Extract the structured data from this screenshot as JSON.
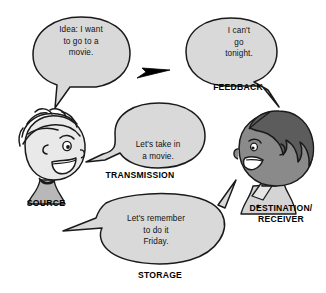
{
  "figure": {
    "background_color": "#ffffff",
    "bubble_fill": "#d9d9d9",
    "outline_color": "#1a1a1a",
    "source_face_color": "#e3e3e3",
    "destination_face_color": "#8a8a8a",
    "destination_hair_color": "#5c5c5c",
    "arrow_color": "#000000"
  },
  "speech_bubbles": [
    {
      "id": "idea",
      "text": "Idea: I want\nto go to a\nmovie.",
      "owner": "source",
      "tail_direction": "down-left"
    },
    {
      "id": "feedback",
      "text": "I can't\ngo\ntonight.",
      "owner": "destination",
      "tail_direction": "down-right"
    },
    {
      "id": "transmission",
      "text": "Let's take in\na movie.",
      "owner": "source",
      "tail_direction": "left"
    },
    {
      "id": "storage",
      "text": "Let's remember\nto do it\nFriday.",
      "owner": "shared",
      "tail_direction": "left-and-right"
    }
  ],
  "labels": {
    "source": "SOURCE",
    "feedback": "FEEDBACK",
    "transmission": "TRANSMISSION",
    "storage": "STORAGE",
    "destination": "DESTINATION/\nRECEIVER"
  },
  "characters": [
    {
      "id": "source-person",
      "role": "SOURCE",
      "facing": "right",
      "expression": "smiling",
      "hair": "wavy-light"
    },
    {
      "id": "destination-person",
      "role": "DESTINATION/RECEIVER",
      "facing": "left",
      "expression": "smiling",
      "hair": "curly-dark"
    }
  ],
  "arrows": [
    {
      "id": "feedback-arrow",
      "points_to": "left",
      "meaning": "feedback travels from receiver back to source"
    }
  ]
}
